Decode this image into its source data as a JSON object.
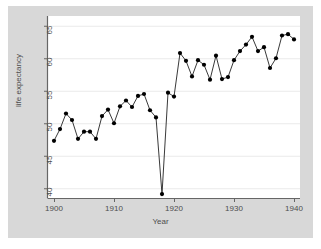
{
  "chart_data": {
    "type": "line",
    "title": "",
    "subtitle": "",
    "xlabel": "Year",
    "ylabel": "life expectancy",
    "xlim": [
      1899,
      1941
    ],
    "ylim": [
      38.5,
      66.5
    ],
    "xticks": [
      1900,
      1910,
      1920,
      1930,
      1940
    ],
    "yticks": [
      40,
      45,
      50,
      55,
      60,
      65
    ],
    "grid": "horizontal",
    "legend": "none",
    "marker": "filled-circle",
    "line_color": "#222222",
    "marker_color": "#000000",
    "plot_background": "#ffffff",
    "figure_background": "#d8d8d8",
    "gridline_color": "#eaeaea",
    "annotations": [
      "Sharp drop at 1918 corresponding to the influenza pandemic"
    ],
    "x": [
      1900,
      1901,
      1902,
      1903,
      1904,
      1905,
      1906,
      1907,
      1908,
      1909,
      1910,
      1911,
      1912,
      1913,
      1914,
      1915,
      1916,
      1917,
      1918,
      1919,
      1920,
      1921,
      1922,
      1923,
      1924,
      1925,
      1926,
      1927,
      1928,
      1929,
      1930,
      1931,
      1932,
      1933,
      1934,
      1935,
      1936,
      1937,
      1938,
      1939,
      1940
    ],
    "values": [
      47.3,
      49.1,
      51.5,
      50.5,
      47.6,
      48.7,
      48.7,
      47.6,
      51.1,
      52.1,
      50.0,
      52.6,
      53.5,
      52.5,
      54.2,
      54.5,
      52.0,
      50.9,
      39.1,
      54.7,
      54.1,
      60.8,
      59.6,
      57.2,
      59.7,
      59.0,
      56.7,
      60.4,
      56.8,
      57.1,
      59.7,
      61.1,
      62.1,
      63.3,
      61.1,
      61.7,
      58.5,
      60.0,
      63.5,
      63.7,
      62.9
    ]
  },
  "axis": {
    "xtick_labels": [
      "1900",
      "1910",
      "1920",
      "1930",
      "1940"
    ],
    "ytick_labels": [
      "40",
      "45",
      "50",
      "55",
      "60",
      "65"
    ],
    "xlabel": "Year",
    "ylabel": "life expectancy"
  }
}
